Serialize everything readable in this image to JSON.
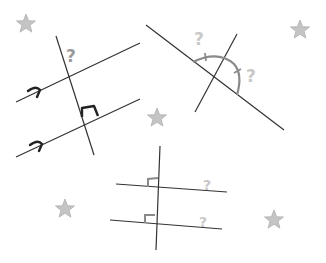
{
  "diagram": {
    "colors": {
      "line": "#333333",
      "mark_dark": "#222222",
      "mark_gray": "#8a8a8a",
      "question_gray": "#9a9a9a",
      "question_light": "#c8c8c8",
      "star_fill": "#c4c4c4",
      "star_stroke": "#b0b0b0"
    },
    "figures": [
      {
        "id": "parallel-lines-with-transversal",
        "marks": [
          "parallel-arrow",
          "parallel-arrow",
          "right-angle"
        ],
        "unknown_label": "?"
      },
      {
        "id": "straight-angle-with-line",
        "marks": [
          "semicircle-arc",
          "tick",
          "tick"
        ],
        "unknown_labels": [
          "?",
          "?"
        ]
      },
      {
        "id": "two-lines-perpendicular-to-transversal",
        "marks": [
          "right-angle",
          "right-angle"
        ],
        "unknown_labels": [
          "?",
          "?"
        ]
      }
    ],
    "labels": {
      "q1": "?",
      "q2a": "?",
      "q2b": "?",
      "q3a": "?",
      "q3b": "?"
    },
    "stars": [
      {
        "x": 26,
        "y": 24
      },
      {
        "x": 300,
        "y": 30
      },
      {
        "x": 157,
        "y": 118
      },
      {
        "x": 65,
        "y": 209
      },
      {
        "x": 274,
        "y": 220
      }
    ]
  }
}
